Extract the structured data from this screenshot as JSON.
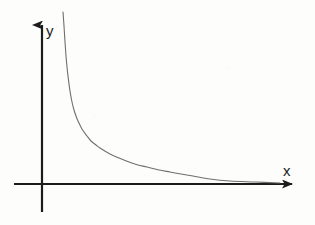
{
  "figure": {
    "name": "reciprocal-function-graph",
    "background_color": "#fdfdfc",
    "axis_color": "#1c1c1c",
    "curve_color": "#6f6f6f"
  },
  "axes": {
    "x_axis": {
      "label": "x",
      "label_position": {
        "x": 283,
        "y": 176
      },
      "start": {
        "x": 14,
        "y": 184
      },
      "end": {
        "x": 295,
        "y": 184
      },
      "arrow": "right",
      "stroke_width": 2.2
    },
    "y_axis": {
      "label": "y",
      "label_position": {
        "x": 46,
        "y": 36
      },
      "start": {
        "x": 42,
        "y": 212
      },
      "end": {
        "x": 42,
        "y": 22
      },
      "arrow": "up",
      "stroke_width": 2.2
    },
    "origin": {
      "x": 42,
      "y": 184
    }
  },
  "chart_data": {
    "type": "line",
    "title": "",
    "subtitle": "",
    "xlabel": "x",
    "ylabel": "y",
    "grid": false,
    "legend": null,
    "annotations": [],
    "xlim": [
      0,
      12
    ],
    "ylim": [
      0,
      8
    ],
    "series": [
      {
        "name": "y = 1/x",
        "equation": "y = 1/x",
        "color": "#6f6f6f",
        "stroke_width": 1.1,
        "x": [
          0.52,
          0.6,
          0.7,
          0.8,
          0.9,
          1.0,
          1.2,
          1.4,
          1.6,
          1.8,
          2.0,
          2.4,
          2.8,
          3.2,
          3.6,
          4.0,
          4.8,
          5.6,
          6.4,
          7.2,
          8.0,
          9.0,
          10.0,
          11.0,
          12.0
        ],
        "y": [
          7.6,
          6.6,
          5.6,
          4.9,
          4.4,
          3.95,
          3.3,
          2.82,
          2.47,
          2.2,
          1.98,
          1.65,
          1.41,
          1.24,
          1.1,
          0.99,
          0.82,
          0.71,
          0.62,
          0.55,
          0.49,
          0.44,
          0.4,
          0.36,
          0.33
        ],
        "pixel_points": [
          [
            63,
            12
          ],
          [
            64,
            26
          ],
          [
            65,
            42
          ],
          [
            66,
            56
          ],
          [
            67,
            67
          ],
          [
            68,
            76
          ],
          [
            70,
            91
          ],
          [
            72,
            102
          ],
          [
            74,
            110
          ],
          [
            76,
            116
          ],
          [
            78,
            121
          ],
          [
            82,
            129
          ],
          [
            87,
            136
          ],
          [
            91,
            141
          ],
          [
            96,
            145
          ],
          [
            100,
            148
          ],
          [
            110,
            154
          ],
          [
            119,
            158
          ],
          [
            129,
            162
          ],
          [
            138,
            165
          ],
          [
            147,
            167
          ],
          [
            159,
            170
          ],
          [
            170,
            172
          ],
          [
            181,
            174
          ],
          [
            193,
            176
          ],
          [
            210,
            179
          ],
          [
            230,
            181
          ],
          [
            255,
            182
          ],
          [
            280,
            183
          ]
        ],
        "asymptotes": {
          "vertical": {
            "x_value": 0,
            "pixel_x": 42
          },
          "horizontal": {
            "y_value": 0,
            "pixel_y": 184
          }
        }
      }
    ]
  }
}
